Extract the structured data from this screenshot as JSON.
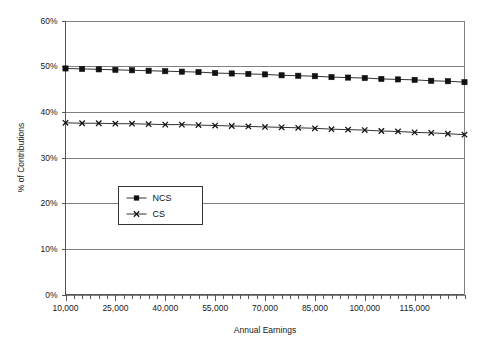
{
  "chart_data": {
    "type": "line",
    "title": "",
    "xlabel": "Annual Earnings",
    "ylabel": "% of Contributions",
    "xlim": [
      10000,
      130000
    ],
    "ylim": [
      0,
      60
    ],
    "grid": true,
    "legend_position": "inside-left-middle",
    "y_tick_labels": [
      "0%",
      "10%",
      "20%",
      "30%",
      "40%",
      "50%",
      "60%"
    ],
    "y_ticks": [
      0,
      10,
      20,
      30,
      40,
      50,
      60
    ],
    "x_tick_labels": [
      "10,000",
      "25,000",
      "40,000",
      "55,000",
      "70,000",
      "85,000",
      "100,000",
      "115,000"
    ],
    "x_ticks": [
      10000,
      25000,
      40000,
      55000,
      70000,
      85000,
      100000,
      115000
    ],
    "x": [
      10000,
      15000,
      20000,
      25000,
      30000,
      35000,
      40000,
      45000,
      50000,
      55000,
      60000,
      65000,
      70000,
      75000,
      80000,
      85000,
      90000,
      95000,
      100000,
      105000,
      110000,
      115000,
      120000,
      125000,
      130000
    ],
    "series": [
      {
        "name": "NCS",
        "marker": "square",
        "values": [
          49.5,
          49.4,
          49.3,
          49.2,
          49.1,
          49.0,
          48.9,
          48.8,
          48.7,
          48.5,
          48.4,
          48.3,
          48.2,
          48.0,
          47.9,
          47.8,
          47.6,
          47.5,
          47.4,
          47.2,
          47.1,
          47.0,
          46.8,
          46.7,
          46.5
        ]
      },
      {
        "name": "CS",
        "marker": "x",
        "values": [
          37.6,
          37.5,
          37.5,
          37.4,
          37.4,
          37.3,
          37.2,
          37.2,
          37.1,
          37.0,
          36.9,
          36.8,
          36.7,
          36.6,
          36.5,
          36.4,
          36.2,
          36.1,
          36.0,
          35.8,
          35.7,
          35.5,
          35.4,
          35.2,
          35.0
        ]
      }
    ]
  },
  "legend": {
    "items": [
      {
        "label": "NCS"
      },
      {
        "label": "CS"
      }
    ]
  }
}
